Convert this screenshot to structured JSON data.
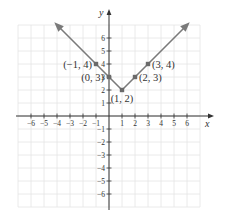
{
  "chart_data": {
    "type": "line",
    "title": "",
    "xlabel": "x",
    "ylabel": "y",
    "xlim": [
      -7,
      7
    ],
    "ylim": [
      -7,
      7
    ],
    "grid": true,
    "x_ticks": [
      -6,
      -5,
      -4,
      -3,
      -2,
      -1,
      1,
      2,
      3,
      4,
      5,
      6
    ],
    "y_ticks": [
      -6,
      -5,
      -4,
      -3,
      -2,
      -1,
      1,
      2,
      3,
      4,
      5,
      6
    ],
    "x_tick_labels": [
      "−6",
      "−5",
      "−4",
      "−3",
      "−2",
      "−1",
      "1",
      "2",
      "3",
      "4",
      "5",
      "6"
    ],
    "y_tick_labels": [
      "−6",
      "−5",
      "−4",
      "−3",
      "−2",
      "−1",
      "1",
      "2",
      "3",
      "4",
      "5",
      "6"
    ],
    "series": [
      {
        "name": "y = |x − 1| + 2",
        "x": [
          -4,
          -1,
          0,
          1,
          2,
          3,
          6
        ],
        "y": [
          7,
          4,
          3,
          2,
          3,
          4,
          7
        ],
        "arrows_at_ends": true
      }
    ],
    "points": [
      {
        "x": -1,
        "y": 4,
        "label": "(−1, 4)"
      },
      {
        "x": 0,
        "y": 3,
        "label": "(0, 3)"
      },
      {
        "x": 1,
        "y": 2,
        "label": "(1, 2)"
      },
      {
        "x": 2,
        "y": 3,
        "label": "(2, 3)"
      },
      {
        "x": 3,
        "y": 4,
        "label": "(3, 4)"
      }
    ],
    "colors": {
      "line": "#7a7a7a",
      "point": "#6a6a6a",
      "axis": "#333333",
      "grid": "#e4e4e4"
    }
  }
}
